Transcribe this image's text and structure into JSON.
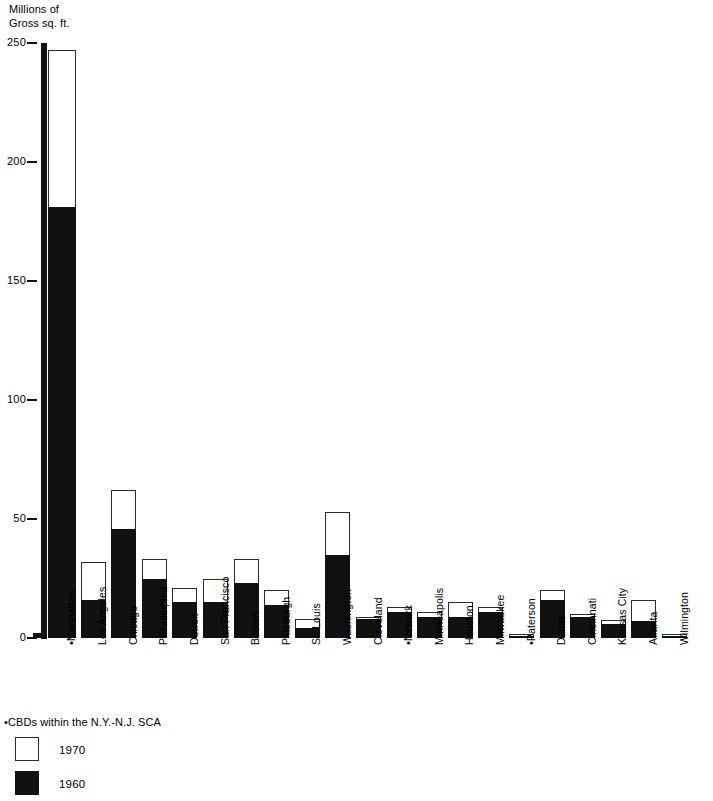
{
  "axis": {
    "y_title": "Millions of\nGross sq. ft.",
    "y_ticks": [
      0,
      50,
      100,
      150,
      200,
      250
    ],
    "y_min": 0,
    "y_max": 250
  },
  "legend": {
    "note": "•CBDs  within the N.Y.-N.J. SCA",
    "items": [
      {
        "label": "1970",
        "swatch": "white"
      },
      {
        "label": "1960",
        "swatch": "black"
      }
    ]
  },
  "colors": {
    "bar_1960": "#111111",
    "bar_1970": "#ffffff",
    "bar_outline": "#2b2b2b",
    "axis": "#111111",
    "background": "#ffffff"
  },
  "chart_data": {
    "type": "bar",
    "title": "",
    "subtitle": "",
    "xlabel": "",
    "ylabel": "Millions of Gross sq. ft.",
    "ylim": [
      0,
      250
    ],
    "yticks": [
      0,
      50,
      100,
      150,
      200,
      250
    ],
    "grid": false,
    "legend_position": "bottom-left",
    "stacking": "overlaid",
    "note": "Each bar shows the 1970 total (white, outlined) with the 1960 amount drawn as a solid black sub-bar from the baseline.",
    "categories": [
      "•Manhattan",
      "Los Angeles",
      "Chicago",
      "Philadelphia",
      "Detroit",
      "San Francisco",
      "Boston",
      "Pittsburgh",
      "St. Louis",
      "Washington",
      "Cleveland",
      "•Newark",
      "Minneapolis",
      "Houston",
      "Milwaukee",
      "•Paterson",
      "Dallas",
      "Cincinnati",
      "Kansas City",
      "Atlanta",
      "Wilmington"
    ],
    "series": [
      {
        "name": "1970",
        "values": [
          247,
          32,
          62,
          33,
          21,
          25,
          33,
          20,
          8,
          53,
          9,
          13,
          11,
          15,
          13,
          1.5,
          20,
          10,
          7.5,
          16,
          1.5
        ]
      },
      {
        "name": "1960",
        "values": [
          181,
          16,
          46,
          25,
          15,
          15,
          23,
          14,
          4,
          35,
          8,
          11,
          9,
          9,
          11,
          1,
          16,
          9,
          6,
          7,
          1
        ]
      }
    ]
  }
}
